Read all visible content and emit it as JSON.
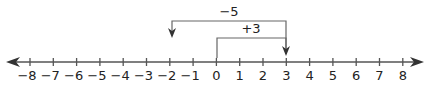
{
  "diagram": {
    "type": "number-line",
    "range": [
      -8,
      8
    ],
    "tick_labels": [
      "−8",
      "−7",
      "−6",
      "−5",
      "−4",
      "−3",
      "−2",
      "−1",
      "0",
      "1",
      "2",
      "3",
      "4",
      "5",
      "6",
      "7",
      "8"
    ],
    "operations": [
      {
        "label": "+3",
        "from": 0,
        "to": 3
      },
      {
        "label": "−5",
        "from": 3,
        "to": -2
      }
    ],
    "colors": {
      "line": "#555555",
      "text": "#222222"
    }
  }
}
